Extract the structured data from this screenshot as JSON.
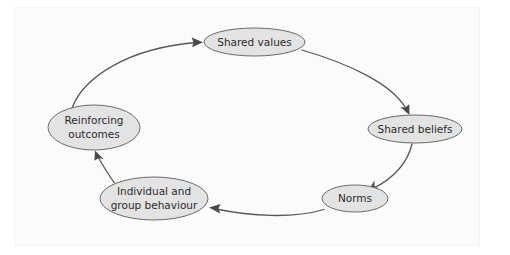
{
  "figure": {
    "background_color": "#ffffff",
    "node_fill_color": "#e3e3e3",
    "node_stroke_color": "#6a6a6a",
    "arrow_color": "#585858",
    "text_color": "#2b2b2b"
  },
  "nodes": [
    {
      "id": "shared-values",
      "label": "Shared values",
      "lines": [
        "Shared values"
      ],
      "cx": 254.5,
      "cy": 42,
      "rx": 50.5,
      "ry": 14
    },
    {
      "id": "shared-beliefs",
      "label": "Shared beliefs",
      "lines": [
        "Shared beliefs"
      ],
      "cx": 415,
      "cy": 129,
      "rx": 47,
      "ry": 14
    },
    {
      "id": "norms",
      "label": "Norms",
      "lines": [
        "Norms"
      ],
      "cx": 355,
      "cy": 198.5,
      "rx": 33,
      "ry": 13.5
    },
    {
      "id": "individual-and-group-behaviour",
      "label": "Individual and group behaviour",
      "lines": [
        "Individual and",
        "group behaviour"
      ],
      "cx": 154,
      "cy": 198.5,
      "rx": 54,
      "ry": 21.5
    },
    {
      "id": "reinforcing-outcomes",
      "label": "Reinforcing outcomes",
      "lines": [
        "Reinforcing",
        "outcomes"
      ],
      "cx": 94,
      "cy": 127.5,
      "rx": 46,
      "ry": 22.5
    }
  ],
  "links": [
    {
      "id": "reinforcing-outcomes-to-shared-values",
      "from": "reinforcing-outcomes",
      "to": "shared-values",
      "direction": "clockwise",
      "has_arrowhead": true
    },
    {
      "id": "shared-values-to-shared-beliefs",
      "from": "shared-values",
      "to": "shared-beliefs",
      "direction": "clockwise",
      "has_arrowhead": true
    },
    {
      "id": "shared-beliefs-to-norms",
      "from": "shared-beliefs",
      "to": "norms",
      "direction": "clockwise",
      "has_arrowhead": true
    },
    {
      "id": "norms-to-individual-and-group-behaviour",
      "from": "norms",
      "to": "individual-and-group-behaviour",
      "direction": "clockwise",
      "has_arrowhead": true
    },
    {
      "id": "individual-and-group-behaviour-to-reinforcing-outcomes",
      "from": "individual-and-group-behaviour",
      "to": "reinforcing-outcomes",
      "direction": "clockwise",
      "has_arrowhead": true
    }
  ]
}
